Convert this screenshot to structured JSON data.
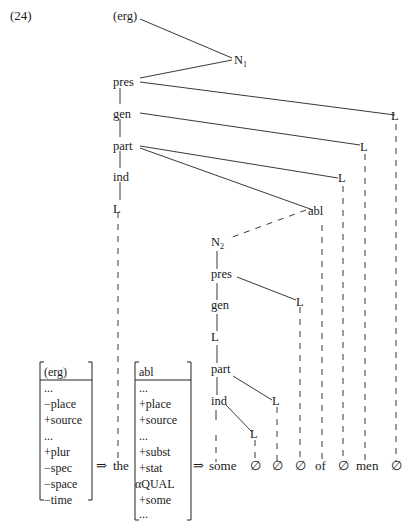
{
  "example_number": "(24)",
  "tree": {
    "upper": {
      "erg": "(erg)",
      "n1": "N",
      "n1_sub": "1",
      "pres": "pres",
      "gen": "gen",
      "part": "part",
      "ind": "ind",
      "l_left": "L",
      "l_pres": "L",
      "l_gen": "L",
      "l_part": "L",
      "abl": "abl"
    },
    "lower": {
      "n2": "N",
      "n2_sub": "2",
      "pres": "pres",
      "gen": "gen",
      "l_mid": "L",
      "part": "part",
      "ind": "ind",
      "l_pres": "L",
      "l_part": "L",
      "l_ind": "L"
    }
  },
  "matrix_left": {
    "header": "(erg)",
    "features": [
      "...",
      "−place",
      "+source",
      "...",
      "+plur",
      "−spec",
      "−space",
      "−time"
    ]
  },
  "matrix_right": {
    "header": "abl",
    "features": [
      "...",
      "+place",
      "+source",
      "...",
      "+subst",
      "+stat",
      "αQUAL",
      "+some",
      "..."
    ]
  },
  "arrows": [
    "⇒",
    "⇒"
  ],
  "surface": {
    "the": "the",
    "words": [
      "some",
      "∅",
      "∅",
      "∅",
      "of",
      "∅",
      "men",
      "∅"
    ]
  }
}
